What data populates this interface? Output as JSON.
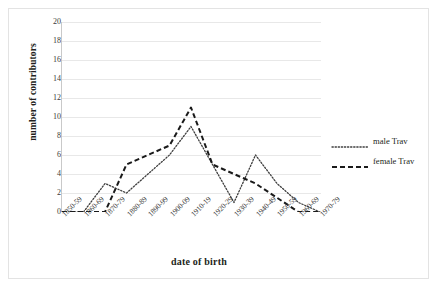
{
  "chart_data": {
    "type": "line",
    "title": "",
    "xlabel": "date of birth",
    "ylabel": "number of contributors",
    "categories": [
      "1850-59",
      "1860-69",
      "1870-79",
      "1880-89",
      "1890-99",
      "1900-09",
      "1910-19",
      "1920-29",
      "1930-39",
      "1940-49",
      "1950-59",
      "1960-69",
      "1970-79"
    ],
    "series": [
      {
        "name": "male Trav",
        "style": "dotted",
        "color": "#3f3f3f",
        "values": [
          0,
          0,
          3,
          2,
          4,
          6,
          9,
          5,
          1,
          6,
          3,
          1,
          0
        ]
      },
      {
        "name": "female Trav",
        "style": "dashed",
        "color": "#1a1a1a",
        "values": [
          0,
          0,
          0,
          5,
          6,
          7,
          11,
          5,
          4,
          3,
          1.5,
          0,
          0
        ]
      }
    ],
    "ylim": [
      0,
      20
    ],
    "ytick_step": 2,
    "yticks": [
      "0",
      "2",
      "4",
      "6",
      "8",
      "10",
      "12",
      "14",
      "16",
      "18",
      "20"
    ],
    "grid": "horizontal",
    "legend_position": "right"
  },
  "legend": {
    "entries": [
      {
        "label": "male Trav"
      },
      {
        "label": "female Trav"
      }
    ]
  },
  "colors": {
    "gridline": "#e8e8e8",
    "axis": "#c9c9c9",
    "border": "#e3e3e3",
    "text": "#231f20"
  }
}
